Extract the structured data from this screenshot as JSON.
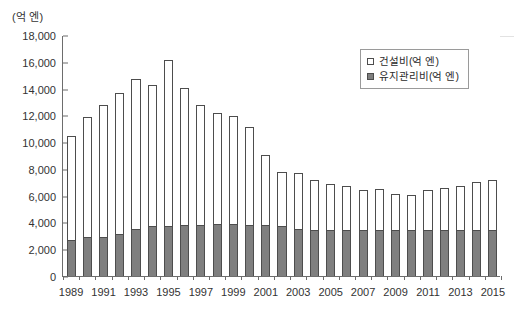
{
  "chart_data": {
    "type": "bar",
    "subtype": "stacked-vertical",
    "title": "",
    "unit_label": "(억 엔)",
    "xlabel": "",
    "ylabel": "(억 엔)",
    "ylim": [
      0,
      18000
    ],
    "ytick_step": 2000,
    "ytick_labels": [
      "0",
      "2,000",
      "4,000",
      "6,000",
      "8,000",
      "10,000",
      "12,000",
      "14,000",
      "16,000",
      "18,000"
    ],
    "ytick_values": [
      0,
      2000,
      4000,
      6000,
      8000,
      10000,
      12000,
      14000,
      16000,
      18000
    ],
    "grid": false,
    "legend_position": "top-right",
    "categories": [
      "1989",
      "1990",
      "1991",
      "1992",
      "1993",
      "1994",
      "1995",
      "1996",
      "1997",
      "1998",
      "1999",
      "2000",
      "2001",
      "2002",
      "2003",
      "2004",
      "2005",
      "2006",
      "2007",
      "2008",
      "2009",
      "2010",
      "2011",
      "2012",
      "2013",
      "2014",
      "2015"
    ],
    "xtick_labels_shown": [
      "1989",
      "1991",
      "1993",
      "1995",
      "1997",
      "1999",
      "2001",
      "2003",
      "2005",
      "2007",
      "2009",
      "2011",
      "2013",
      "2015"
    ],
    "series": [
      {
        "name": "유지관리비(억 엔)",
        "fill": "#7f7f7f",
        "values": [
          2700,
          2900,
          2950,
          3150,
          3500,
          3700,
          3750,
          3800,
          3800,
          3850,
          3850,
          3800,
          3800,
          3700,
          3500,
          3400,
          3400,
          3400,
          3400,
          3400,
          3400,
          3400,
          3400,
          3450,
          3450,
          3450,
          3450
        ]
      },
      {
        "name": "건설비(억 엔)",
        "fill": "#ffffff",
        "values": [
          7750,
          8950,
          9850,
          10550,
          11200,
          10550,
          12350,
          10250,
          9000,
          8350,
          8100,
          7350,
          5250,
          4100,
          4200,
          3800,
          3500,
          3350,
          3050,
          3100,
          2750,
          2650,
          3000,
          3100,
          3250,
          3600,
          3750
        ]
      }
    ],
    "totals": [
      10450,
      11850,
      12800,
      13700,
      14700,
      14250,
      16100,
      14050,
      12800,
      12200,
      11950,
      11150,
      9050,
      7800,
      7700,
      7200,
      6900,
      6750,
      6450,
      6500,
      6150,
      6050,
      6400,
      6550,
      6700,
      7050,
      7200
    ]
  },
  "legend": {
    "items": [
      {
        "label": "건설비(억 엔)",
        "swatch": "hollow"
      },
      {
        "label": "유지관리비(억 엔)",
        "swatch": "filled"
      }
    ]
  }
}
